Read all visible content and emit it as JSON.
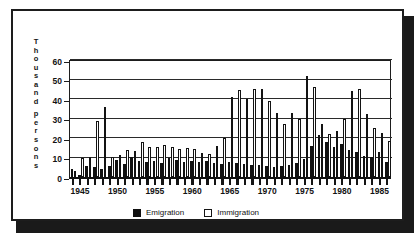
{
  "chart_data": {
    "type": "bar",
    "title": "",
    "subtitle": "",
    "xlabel": "",
    "ylabel": "Thousand persons",
    "ylabel_chars": [
      "T",
      "h",
      "o",
      "u",
      "s",
      "a",
      "n",
      "d",
      "",
      "p",
      "e",
      "r",
      "s",
      "o",
      "n",
      "s"
    ],
    "ylim": [
      0,
      60
    ],
    "yticks": [
      0,
      10,
      20,
      30,
      40,
      50,
      60
    ],
    "xlim": [
      1944,
      1986
    ],
    "xticks": [
      1945,
      1950,
      1955,
      1960,
      1965,
      1970,
      1975,
      1980,
      1985
    ],
    "grid": true,
    "grid_axis": "y",
    "legend_position": "bottom-center",
    "orientation": "vertical",
    "grouping": "grouped",
    "x": [
      1944,
      1945,
      1946,
      1947,
      1948,
      1949,
      1950,
      1951,
      1952,
      1953,
      1954,
      1955,
      1956,
      1957,
      1958,
      1959,
      1960,
      1961,
      1962,
      1963,
      1964,
      1965,
      1966,
      1967,
      1968,
      1969,
      1970,
      1971,
      1972,
      1973,
      1974,
      1975,
      1976,
      1977,
      1978,
      1979,
      1980,
      1981,
      1982,
      1983,
      1984,
      1985,
      1986
    ],
    "categories": [
      "1944",
      "1945",
      "1946",
      "1947",
      "1948",
      "1949",
      "1950",
      "1951",
      "1952",
      "1953",
      "1954",
      "1955",
      "1956",
      "1957",
      "1958",
      "1959",
      "1960",
      "1961",
      "1962",
      "1963",
      "1964",
      "1965",
      "1966",
      "1967",
      "1968",
      "1969",
      "1970",
      "1971",
      "1972",
      "1973",
      "1974",
      "1975",
      "1976",
      "1977",
      "1978",
      "1979",
      "1980",
      "1981",
      "1982",
      "1983",
      "1984",
      "1985",
      "1986"
    ],
    "series": [
      {
        "name": "Emigration",
        "color": "#101010",
        "fill": "solid-black",
        "values": [
          4.0,
          1.0,
          5.5,
          5.0,
          4.0,
          5.5,
          8.5,
          6.5,
          10.5,
          8.0,
          7.5,
          8.0,
          7.0,
          9.5,
          8.5,
          7.5,
          8.0,
          7.5,
          8.0,
          7.0,
          6.5,
          7.5,
          7.0,
          6.5,
          6.0,
          6.0,
          5.5,
          5.0,
          5.5,
          6.0,
          7.0,
          9.0,
          16.0,
          21.5,
          18.0,
          15.5,
          17.0,
          14.0,
          13.0,
          11.0,
          10.5,
          13.0,
          7.5
        ]
      },
      {
        "name": "Immigration",
        "color": "#ffffff",
        "fill": "white-outline",
        "values": [
          3.0,
          10.0,
          10.5,
          28.5,
          36.0,
          10.5,
          11.5,
          14.0,
          13.5,
          18.0,
          15.5,
          15.5,
          16.5,
          15.5,
          14.5,
          15.0,
          14.5,
          12.5,
          12.0,
          16.0,
          20.0,
          41.0,
          44.5,
          40.0,
          45.0,
          45.0,
          39.0,
          33.0,
          27.0,
          33.0,
          30.0,
          52.0,
          46.0,
          27.0,
          22.0,
          23.5,
          30.0,
          44.0,
          45.0,
          32.5,
          25.0,
          22.5,
          18.5
        ]
      }
    ]
  },
  "legend": {
    "items": [
      {
        "label": "Emigration",
        "swatch": "filled-black-square"
      },
      {
        "label": "Immigration",
        "swatch": "white-outline-square"
      }
    ]
  },
  "axis": {
    "y_tick_labels": [
      "60",
      "50",
      "40",
      "30",
      "20",
      "10",
      "0"
    ],
    "x_tick_labels": [
      "1945",
      "1950",
      "1955",
      "1960",
      "1965",
      "1970",
      "1975",
      "1980",
      "1985"
    ]
  }
}
